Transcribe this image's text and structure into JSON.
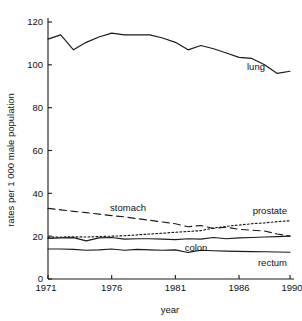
{
  "chart_data": {
    "type": "line",
    "title": "",
    "xlabel": "year",
    "ylabel": "rates per 1 000 male population",
    "xlim": [
      1971,
      1990
    ],
    "ylim": [
      0,
      120
    ],
    "grid": false,
    "legend_position": "inline-end-of-line",
    "x_ticks": [
      1971,
      1976,
      1981,
      1986,
      1990
    ],
    "x_tick_labels": [
      "1971",
      "1976",
      "1981",
      "1986",
      "1990"
    ],
    "x_minor_ticks": [
      1971,
      1976,
      1981,
      1986,
      1990
    ],
    "y_ticks": [
      0,
      20,
      40,
      60,
      80,
      100,
      120
    ],
    "y_tick_labels": [
      "0",
      "20",
      "40",
      "60",
      "80",
      "100",
      "120"
    ],
    "x": [
      1971,
      1972,
      1973,
      1974,
      1975,
      1976,
      1977,
      1978,
      1979,
      1980,
      1981,
      1982,
      1983,
      1984,
      1985,
      1986,
      1987,
      1988,
      1989,
      1990
    ],
    "series": [
      {
        "name": "lung",
        "label": "lung",
        "style": "solid",
        "values": [
          112.0,
          114.0,
          107.0,
          110.5,
          113.0,
          114.8,
          114.0,
          114.0,
          114.0,
          112.5,
          110.5,
          107.0,
          109.0,
          107.5,
          105.5,
          103.5,
          103.0,
          100.0,
          96.0,
          97.0
        ]
      },
      {
        "name": "stomach",
        "label": "stomach",
        "style": "long-dash",
        "values": [
          33.0,
          32.3,
          31.6,
          31.0,
          30.3,
          29.6,
          29.0,
          28.2,
          27.4,
          26.6,
          25.8,
          24.4,
          25.0,
          23.6,
          24.2,
          23.2,
          22.8,
          22.4,
          21.0,
          20.0
        ]
      },
      {
        "name": "prostate",
        "label": "prostate",
        "style": "dotted",
        "values": [
          19.5,
          19.6,
          19.7,
          19.6,
          19.8,
          20.0,
          20.2,
          20.6,
          21.0,
          21.4,
          21.8,
          22.2,
          22.6,
          23.8,
          24.6,
          25.2,
          25.8,
          26.2,
          26.8,
          27.2
        ]
      },
      {
        "name": "colon",
        "label": "colon",
        "style": "solid",
        "values": [
          19.0,
          19.2,
          19.3,
          17.8,
          19.2,
          19.4,
          18.6,
          18.8,
          18.8,
          18.6,
          18.4,
          18.8,
          18.6,
          19.4,
          18.8,
          19.2,
          19.4,
          19.6,
          19.8,
          20.0
        ]
      },
      {
        "name": "rectum",
        "label": "rectum",
        "style": "solid",
        "values": [
          14.0,
          14.0,
          13.8,
          13.4,
          13.6,
          14.0,
          13.4,
          13.8,
          13.6,
          13.4,
          13.6,
          12.4,
          13.4,
          13.2,
          13.0,
          12.9,
          12.8,
          12.7,
          12.6,
          12.5
        ]
      }
    ],
    "annotations": [
      {
        "text": "lung",
        "series": "lung"
      },
      {
        "text": "stomach",
        "series": "stomach"
      },
      {
        "text": "prostate",
        "series": "prostate"
      },
      {
        "text": "colon",
        "series": "colon"
      },
      {
        "text": "rectum",
        "series": "rectum"
      }
    ]
  },
  "colors": {
    "ink": "#1a1a1a",
    "background": "#ffffff"
  }
}
